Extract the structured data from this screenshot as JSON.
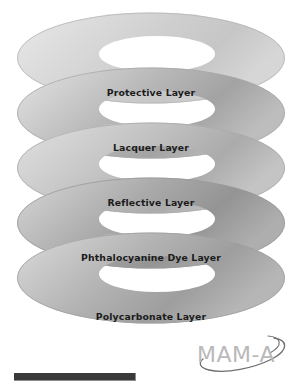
{
  "figure": {
    "background_color": "#ffffff",
    "label_color": "#1b1b1b",
    "layers": [
      {
        "index": 0,
        "label": "Protective Layer",
        "fill_light": "#e4e4e4",
        "fill_mid": "#d2d2d2",
        "fill_dark": "#c3c3c3",
        "edge_color": "#b4b4b4"
      },
      {
        "index": 1,
        "label": "Lacquer Layer",
        "fill_light": "#dcdcdc",
        "fill_mid": "#bfbfbf",
        "fill_dark": "#9f9f9f",
        "edge_color": "#a8a8a8"
      },
      {
        "index": 2,
        "label": "Reflective Layer",
        "fill_light": "#dadada",
        "fill_mid": "#c2c2c2",
        "fill_dark": "#a6a6a6",
        "edge_color": "#aaaaaa"
      },
      {
        "index": 3,
        "label": "Phthalocyanine Dye Layer",
        "fill_light": "#cfcfcf",
        "fill_mid": "#aeaeae",
        "fill_dark": "#909090",
        "edge_color": "#999999"
      },
      {
        "index": 4,
        "label": "Polycarbonate Layer",
        "fill_light": "#d4d4d4",
        "fill_mid": "#b6b6b6",
        "fill_dark": "#9a9a9a",
        "edge_color": "#9f9f9f"
      }
    ]
  },
  "logo": {
    "text": "MAM-A",
    "color": "#b9b9b9",
    "swoosh_color": "#6f6f6f"
  },
  "bottom_bar": {
    "color": "#3a3a3a"
  }
}
